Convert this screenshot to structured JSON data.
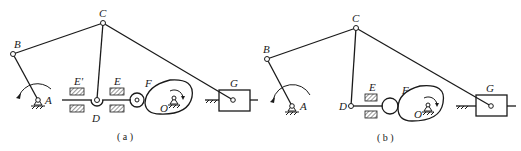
{
  "figure_a": {
    "caption": "( a )",
    "labels": {
      "A": "A",
      "B": "B",
      "C": "C",
      "D": "D",
      "E": "E",
      "E_prime": "E'",
      "F": "F",
      "O": "O",
      "G": "G"
    }
  },
  "figure_b": {
    "caption": "( b )",
    "labels": {
      "A": "A",
      "B": "B",
      "C": "C",
      "D": "D",
      "E": "E",
      "F": "F",
      "O": "O",
      "G": "G"
    }
  }
}
